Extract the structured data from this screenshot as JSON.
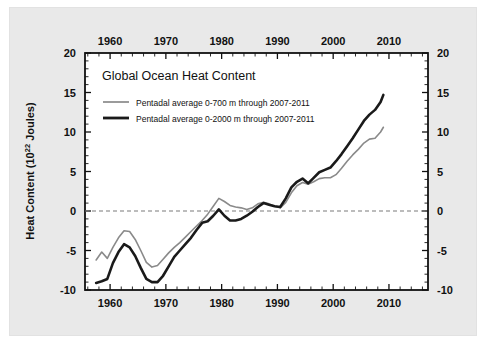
{
  "figure": {
    "background_color": "#e9e9e9",
    "plot_background_color": "#ffffff",
    "frame_color": "#111111"
  },
  "chart_data": {
    "type": "line",
    "title": "Global Ocean Heat Content",
    "xlabel": "",
    "ylabel": "Heat Content (10²² Joules)",
    "ylabel_main": "Heat Content (10",
    "ylabel_exp": "22",
    "ylabel_tail": " Joules)",
    "xlim": [
      1955.5,
      2017.0
    ],
    "ylim": [
      -10,
      20
    ],
    "grid": false,
    "zero_line": 0,
    "zero_line_style": "dashed",
    "legend_position": "upper-left-inside",
    "x_ticks": [
      1960,
      1970,
      1980,
      1990,
      2000,
      2010
    ],
    "x_tick_labels": [
      "1960",
      "1970",
      "1980",
      "1990",
      "2000",
      "2010"
    ],
    "x_minor_tick_interval": 2,
    "y_ticks": [
      -10,
      -5,
      0,
      5,
      10,
      15,
      20
    ],
    "y_tick_labels": [
      "-10",
      "-5",
      "0",
      "5",
      "10",
      "15",
      "20"
    ],
    "y_minor_tick_interval": 1,
    "axes_mirrored": true,
    "series": [
      {
        "name": "Pentadal average 0-700 m through 2007-2011",
        "color": "#8a8a8a",
        "width": 1.6,
        "x": [
          1957.5,
          1958.5,
          1959.5,
          1960.5,
          1961.5,
          1962.5,
          1963.5,
          1964.5,
          1965.5,
          1966.5,
          1967.5,
          1968.5,
          1969.5,
          1970.5,
          1971.5,
          1972.5,
          1973.5,
          1974.5,
          1975.5,
          1976.5,
          1977.5,
          1978.5,
          1979.5,
          1980.5,
          1981.5,
          1982.5,
          1983.5,
          1984.5,
          1985.5,
          1986.5,
          1987.5,
          1988.5,
          1989.5,
          1990.5,
          1991.5,
          1992.5,
          1993.5,
          1994.5,
          1995.5,
          1996.5,
          1997.5,
          1998.5,
          1999.5,
          2000.5,
          2001.5,
          2002.5,
          2003.5,
          2004.5,
          2005.5,
          2006.5,
          2007.5,
          2008.5,
          2009.0
        ],
        "values": [
          -6.2,
          -5.2,
          -6.0,
          -4.6,
          -3.4,
          -2.5,
          -2.6,
          -3.6,
          -5.0,
          -6.5,
          -7.1,
          -6.9,
          -6.1,
          -5.3,
          -4.6,
          -4.0,
          -3.3,
          -2.6,
          -1.9,
          -1.2,
          -0.4,
          0.6,
          1.6,
          1.2,
          0.7,
          0.5,
          0.4,
          0.2,
          0.4,
          0.9,
          1.1,
          0.9,
          0.6,
          0.4,
          1.1,
          2.3,
          3.2,
          3.6,
          3.4,
          3.7,
          4.1,
          4.2,
          4.2,
          4.6,
          5.4,
          6.3,
          7.1,
          7.8,
          8.6,
          9.1,
          9.2,
          10.0,
          10.6
        ]
      },
      {
        "name": "Pentadal average 0-2000 m through 2007-2011",
        "color": "#1a1a1a",
        "width": 2.6,
        "x": [
          1957.5,
          1958.5,
          1959.5,
          1960.5,
          1961.5,
          1962.5,
          1963.5,
          1964.5,
          1965.5,
          1966.5,
          1967.5,
          1968.5,
          1969.5,
          1970.5,
          1971.5,
          1972.5,
          1973.5,
          1974.5,
          1975.5,
          1976.5,
          1977.5,
          1978.5,
          1979.5,
          1980.5,
          1981.5,
          1982.5,
          1983.5,
          1984.5,
          1985.5,
          1986.5,
          1987.5,
          1988.5,
          1989.5,
          1990.5,
          1991.5,
          1992.5,
          1993.5,
          1994.5,
          1995.5,
          1996.5,
          1997.5,
          1998.5,
          1999.5,
          2000.5,
          2001.5,
          2002.5,
          2003.5,
          2004.5,
          2005.5,
          2006.5,
          2007.5,
          2008.5,
          2009.0
        ],
        "values": [
          -9.1,
          -8.9,
          -8.6,
          -6.6,
          -5.2,
          -4.2,
          -4.6,
          -5.7,
          -7.2,
          -8.6,
          -9.0,
          -9.0,
          -8.2,
          -7.0,
          -5.8,
          -5.0,
          -4.2,
          -3.4,
          -2.4,
          -1.5,
          -1.3,
          -0.6,
          0.2,
          -0.6,
          -1.2,
          -1.2,
          -1.0,
          -0.6,
          -0.1,
          0.5,
          1.0,
          0.8,
          0.6,
          0.5,
          1.6,
          3.0,
          3.7,
          4.1,
          3.5,
          4.2,
          4.9,
          5.2,
          5.5,
          6.3,
          7.2,
          8.2,
          9.2,
          10.3,
          11.4,
          12.2,
          12.8,
          13.8,
          14.7
        ]
      }
    ]
  },
  "legend": {
    "entries": [
      {
        "label": "Pentadal average 0-700 m through 2007-2011",
        "color": "#8a8a8a",
        "thickness": "thin"
      },
      {
        "label": "Pentadal average 0-2000 m through 2007-2011",
        "color": "#1a1a1a",
        "thickness": "thick"
      }
    ]
  }
}
